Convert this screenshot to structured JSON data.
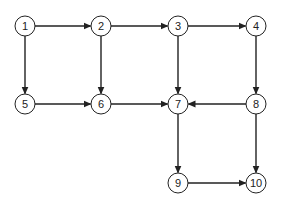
{
  "diagram": {
    "type": "directed-graph",
    "node_radius": 10,
    "stroke_color": "#222222",
    "fill_color": "#ffffff",
    "nodes": [
      {
        "id": "1",
        "label": "1",
        "x": 25,
        "y": 26
      },
      {
        "id": "2",
        "label": "2",
        "x": 101,
        "y": 26
      },
      {
        "id": "3",
        "label": "3",
        "x": 178,
        "y": 26
      },
      {
        "id": "4",
        "label": "4",
        "x": 256,
        "y": 26
      },
      {
        "id": "5",
        "label": "5",
        "x": 25,
        "y": 104
      },
      {
        "id": "6",
        "label": "6",
        "x": 101,
        "y": 104
      },
      {
        "id": "7",
        "label": "7",
        "x": 178,
        "y": 104
      },
      {
        "id": "8",
        "label": "8",
        "x": 256,
        "y": 104
      },
      {
        "id": "9",
        "label": "9",
        "x": 178,
        "y": 183
      },
      {
        "id": "10",
        "label": "10",
        "x": 256,
        "y": 183
      }
    ],
    "edges": [
      {
        "from": "1",
        "to": "2"
      },
      {
        "from": "2",
        "to": "3"
      },
      {
        "from": "3",
        "to": "4"
      },
      {
        "from": "1",
        "to": "5"
      },
      {
        "from": "2",
        "to": "6"
      },
      {
        "from": "3",
        "to": "7"
      },
      {
        "from": "4",
        "to": "8"
      },
      {
        "from": "5",
        "to": "6"
      },
      {
        "from": "6",
        "to": "7"
      },
      {
        "from": "8",
        "to": "7"
      },
      {
        "from": "7",
        "to": "9"
      },
      {
        "from": "8",
        "to": "10"
      },
      {
        "from": "9",
        "to": "10"
      }
    ]
  }
}
